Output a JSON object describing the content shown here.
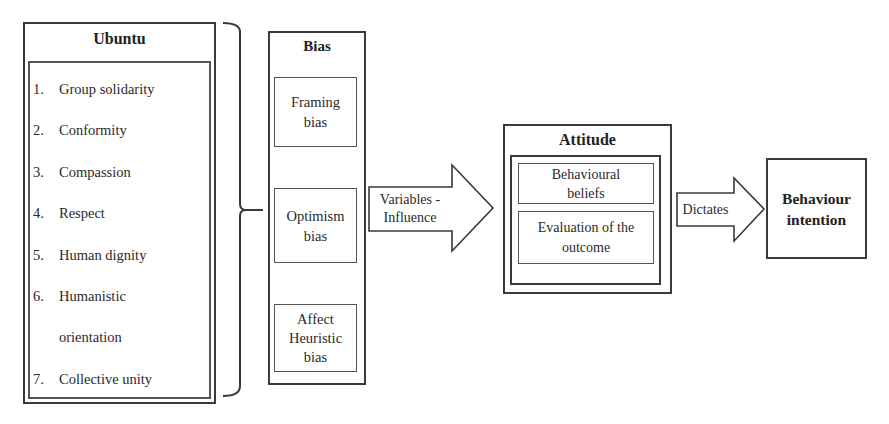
{
  "ubuntu": {
    "title": "Ubuntu",
    "items": [
      {
        "num": "1.",
        "text": "Group solidarity"
      },
      {
        "num": "2.",
        "text": "Conformity"
      },
      {
        "num": "3.",
        "text": "Compassion"
      },
      {
        "num": "4.",
        "text": "Respect"
      },
      {
        "num": "5.",
        "text": "Human dignity"
      },
      {
        "num": "6.",
        "text": "Humanistic"
      },
      {
        "num": "",
        "text": "orientation"
      },
      {
        "num": "7.",
        "text": "Collective unity"
      }
    ]
  },
  "bias": {
    "title": "Bias",
    "items": [
      {
        "line1": "Framing",
        "line2": "bias",
        "line3": ""
      },
      {
        "line1": "Optimism",
        "line2": "bias",
        "line3": ""
      },
      {
        "line1": "Affect",
        "line2": "Heuristic",
        "line3": "bias"
      }
    ]
  },
  "arrows": {
    "variables": {
      "line1": "Variables -",
      "line2": "Influence"
    },
    "dictates": {
      "label": "Dictates"
    }
  },
  "attitude": {
    "title": "Attitude",
    "items": [
      {
        "line1": "Behavioural",
        "line2": "beliefs"
      },
      {
        "line1": "Evaluation of the",
        "line2": "outcome"
      }
    ]
  },
  "behaviour": {
    "line1": "Behaviour",
    "line2": "intention"
  },
  "colors": {
    "stroke": "#3a3a3a",
    "text": "#2a2a2a",
    "background": "#ffffff"
  }
}
